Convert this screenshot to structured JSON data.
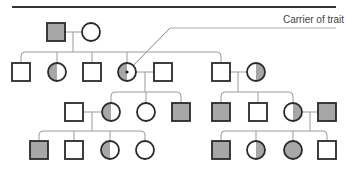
{
  "diagram": {
    "type": "pedigree",
    "annotation": {
      "label": "Carrier of trait",
      "points_to": "II-4"
    },
    "colors": {
      "line": "#2a2a2a",
      "connector": "#9a9a9a",
      "affected_fill": "#a7a7a7",
      "unaffected_fill": "#ffffff",
      "rule": "#333333"
    },
    "legend": {
      "filled": "affected",
      "half_filled": "carrier",
      "empty": "unaffected"
    },
    "individuals": [
      {
        "id": "I-1",
        "sex": "male",
        "status": "affected",
        "cx": 56,
        "cy": 32
      },
      {
        "id": "I-2",
        "sex": "female",
        "status": "unaffected",
        "cx": 91,
        "cy": 32
      },
      {
        "id": "II-1",
        "sex": "male",
        "status": "unaffected",
        "cx": 21,
        "cy": 72
      },
      {
        "id": "II-2",
        "sex": "female",
        "status": "carrier",
        "half": "left",
        "cx": 57,
        "cy": 72
      },
      {
        "id": "II-3",
        "sex": "male",
        "status": "unaffected",
        "cx": 92,
        "cy": 72
      },
      {
        "id": "II-4",
        "sex": "female",
        "status": "carrier",
        "half": "left",
        "cx": 127,
        "cy": 72,
        "dot": true
      },
      {
        "id": "II-5",
        "sex": "male",
        "status": "unaffected",
        "cx": 163,
        "cy": 72
      },
      {
        "id": "II-6",
        "sex": "male",
        "status": "unaffected",
        "cx": 221,
        "cy": 72
      },
      {
        "id": "II-7",
        "sex": "female",
        "status": "carrier",
        "half": "right",
        "cx": 256,
        "cy": 72
      },
      {
        "id": "III-1",
        "sex": "male",
        "status": "unaffected",
        "cx": 74,
        "cy": 112
      },
      {
        "id": "III-2",
        "sex": "female",
        "status": "carrier",
        "half": "left",
        "cx": 111,
        "cy": 112
      },
      {
        "id": "III-3",
        "sex": "female",
        "status": "unaffected",
        "cx": 146,
        "cy": 112
      },
      {
        "id": "III-4",
        "sex": "male",
        "status": "affected",
        "cx": 181,
        "cy": 112
      },
      {
        "id": "III-5",
        "sex": "male",
        "status": "affected",
        "cx": 221,
        "cy": 112
      },
      {
        "id": "III-6",
        "sex": "male",
        "status": "unaffected",
        "cx": 258,
        "cy": 112
      },
      {
        "id": "III-7",
        "sex": "female",
        "status": "carrier",
        "half": "right",
        "cx": 293,
        "cy": 112
      },
      {
        "id": "III-8",
        "sex": "male",
        "status": "affected",
        "cx": 327,
        "cy": 112
      },
      {
        "id": "IV-1",
        "sex": "male",
        "status": "affected",
        "cx": 39,
        "cy": 150
      },
      {
        "id": "IV-2",
        "sex": "male",
        "status": "unaffected",
        "cx": 74,
        "cy": 150
      },
      {
        "id": "IV-3",
        "sex": "female",
        "status": "carrier",
        "half": "left",
        "cx": 110,
        "cy": 150
      },
      {
        "id": "IV-4",
        "sex": "female",
        "status": "unaffected",
        "cx": 145,
        "cy": 150
      },
      {
        "id": "IV-5",
        "sex": "male",
        "status": "affected",
        "cx": 221,
        "cy": 150
      },
      {
        "id": "IV-6",
        "sex": "female",
        "status": "carrier",
        "half": "right",
        "cx": 256,
        "cy": 150
      },
      {
        "id": "IV-7",
        "sex": "female",
        "status": "affected",
        "cx": 293,
        "cy": 150
      },
      {
        "id": "IV-8",
        "sex": "male",
        "status": "unaffected",
        "cx": 327,
        "cy": 150
      }
    ],
    "families": [
      {
        "parents": [
          "I-1",
          "I-2"
        ],
        "mate_y": 32,
        "drop_x": 73,
        "sib_y": 52,
        "children": [
          "II-1",
          "II-2",
          "II-3",
          "II-4",
          "II-6"
        ]
      },
      {
        "parents": [
          "II-4",
          "II-5"
        ],
        "mate_y": 72,
        "drop_x": 145,
        "sib_y": 92,
        "children": [
          "III-2",
          "III-3",
          "III-4"
        ]
      },
      {
        "parents": [
          "II-6",
          "II-7"
        ],
        "mate_y": 72,
        "drop_x": 238,
        "sib_y": 92,
        "children": [
          "III-5",
          "III-6",
          "III-7"
        ]
      },
      {
        "parents": [
          "III-1",
          "III-2"
        ],
        "mate_y": 112,
        "drop_x": 92,
        "sib_y": 131,
        "children": [
          "IV-1",
          "IV-2",
          "IV-3",
          "IV-4"
        ]
      },
      {
        "parents": [
          "III-7",
          "III-8"
        ],
        "mate_y": 112,
        "drop_x": 310,
        "sib_y": 131,
        "children": [
          "IV-5",
          "IV-6",
          "IV-7",
          "IV-8"
        ]
      }
    ]
  }
}
